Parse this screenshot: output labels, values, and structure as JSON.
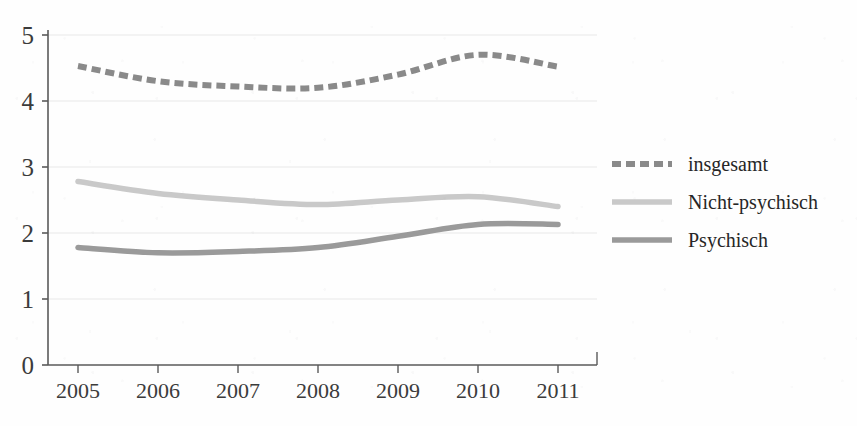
{
  "chart_data": {
    "type": "line",
    "title": "",
    "subtitle": "",
    "xlabel": "",
    "ylabel": "",
    "categories": [
      "2005",
      "2006",
      "2007",
      "2008",
      "2009",
      "2010",
      "2011"
    ],
    "x": [
      2005,
      2006,
      2007,
      2008,
      2009,
      2010,
      2011
    ],
    "xlim": [
      2005,
      2011
    ],
    "ylim": [
      0,
      5
    ],
    "y_ticks": [
      "0",
      "1",
      "2",
      "3",
      "4",
      "5"
    ],
    "grid": true,
    "grid_axis": "y",
    "legend_position": "right",
    "series": [
      {
        "name": "insgesamt",
        "style": "dashed",
        "color": "#8a8a8a",
        "values": [
          4.53,
          4.3,
          4.22,
          4.2,
          4.4,
          4.7,
          4.52
        ]
      },
      {
        "name": "Nicht-psychisch",
        "style": "solid",
        "color": "#c9c9c9",
        "values": [
          2.78,
          2.6,
          2.5,
          2.43,
          2.5,
          2.55,
          2.4
        ]
      },
      {
        "name": "Psychisch",
        "style": "solid",
        "color": "#9a9a9a",
        "values": [
          1.78,
          1.7,
          1.72,
          1.78,
          1.95,
          2.13,
          2.13
        ]
      }
    ]
  },
  "axes": {
    "y_tick_labels": [
      "5",
      "4",
      "3",
      "2",
      "1",
      "0"
    ],
    "x_tick_labels": [
      "2005",
      "2006",
      "2007",
      "2008",
      "2009",
      "2010",
      "2011"
    ]
  },
  "legend": {
    "entries": [
      {
        "label": "insgesamt"
      },
      {
        "label": "Nicht-psychisch"
      },
      {
        "label": "Psychisch"
      }
    ]
  },
  "colors": {
    "insgesamt": "#8a8a8a",
    "nicht_psychisch": "#c9c9c9",
    "psychisch": "#9a9a9a",
    "axis": "#555555",
    "grid": "#e6e6e6",
    "text": "#2e2e2e",
    "background": "#fefefe"
  }
}
